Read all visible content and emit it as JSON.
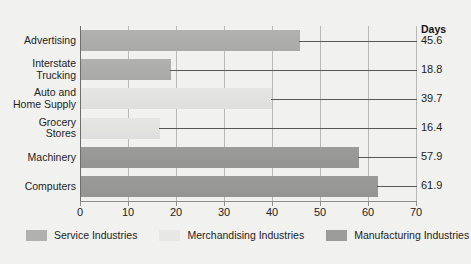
{
  "chart_data": {
    "type": "bar",
    "orientation": "horizontal",
    "title": "",
    "xlabel": "",
    "ylabel": "",
    "value_axis_header": "Days",
    "xlim": [
      0,
      70
    ],
    "xticks": [
      0,
      10,
      20,
      30,
      40,
      50,
      60,
      70
    ],
    "xtick_labels": [
      "0",
      "10",
      "20",
      "30",
      "40",
      "50",
      "60",
      "70"
    ],
    "grid": true,
    "legend_position": "bottom",
    "categories": [
      "Advertising",
      "Interstate\nTrucking",
      "Auto and\nHome Supply",
      "Grocery\nStores",
      "Machinery",
      "Computers"
    ],
    "values": [
      45.6,
      18.8,
      39.7,
      16.4,
      57.9,
      61.9
    ],
    "value_labels": [
      "45.6",
      "18.8",
      "39.7",
      "16.4",
      "57.9",
      "61.9"
    ],
    "groups": [
      "Service Industries",
      "Service Industries",
      "Merchandising Industries",
      "Merchandising Industries",
      "Manufacturing Industries",
      "Manufacturing Industries"
    ],
    "legend": [
      {
        "label": "Service Industries",
        "key": "service",
        "color": "#b1b1af"
      },
      {
        "label": "Merchandising Industries",
        "key": "merchandising",
        "color": "#e7e7e5"
      },
      {
        "label": "Manufacturing Industries",
        "key": "manufacturing",
        "color": "#9b9b99"
      }
    ],
    "bars": [
      {
        "category": "Advertising",
        "label_lines": [
          "Advertising"
        ],
        "value": 45.6,
        "value_label": "45.6",
        "group": "service"
      },
      {
        "category": "Interstate Trucking",
        "label_lines": [
          "Interstate",
          "Trucking"
        ],
        "value": 18.8,
        "value_label": "18.8",
        "group": "service"
      },
      {
        "category": "Auto and Home Supply",
        "label_lines": [
          "Auto and",
          "Home Supply"
        ],
        "value": 39.7,
        "value_label": "39.7",
        "group": "merchandising"
      },
      {
        "category": "Grocery Stores",
        "label_lines": [
          "Grocery",
          "Stores"
        ],
        "value": 16.4,
        "value_label": "16.4",
        "group": "merchandising"
      },
      {
        "category": "Machinery",
        "label_lines": [
          "Machinery"
        ],
        "value": 57.9,
        "value_label": "57.9",
        "group": "manufacturing"
      },
      {
        "category": "Computers",
        "label_lines": [
          "Computers"
        ],
        "value": 61.9,
        "value_label": "61.9",
        "group": "manufacturing"
      }
    ]
  }
}
